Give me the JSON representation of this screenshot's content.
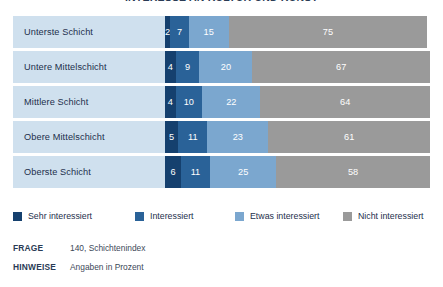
{
  "title": "INTERESSE AN KULTUR UND KUNST",
  "chart_data": {
    "type": "bar",
    "orientation": "horizontal",
    "stacked": true,
    "title": "INTERESSE AN KULTUR UND KUNST",
    "xlabel": "",
    "ylabel": "",
    "xlim": [
      0,
      100
    ],
    "grid": false,
    "legend_position": "bottom",
    "categories": [
      "Unterste Schicht",
      "Untere Mittelschicht",
      "Mittlere Schicht",
      "Obere Mittelschicht",
      "Oberste Schicht"
    ],
    "series": [
      {
        "name": "Sehr interessiert",
        "color": "#15406e",
        "values": [
          2,
          4,
          4,
          5,
          6
        ]
      },
      {
        "name": "Interessiert",
        "color": "#2a6298",
        "values": [
          7,
          9,
          10,
          11,
          11
        ]
      },
      {
        "name": "Etwas interessiert",
        "color": "#7ba7cf",
        "values": [
          15,
          20,
          22,
          23,
          25
        ]
      },
      {
        "name": "Nicht interessiert",
        "color": "#9a9a9a",
        "values": [
          75,
          67,
          64,
          61,
          58
        ]
      }
    ]
  },
  "rows": [
    {
      "label": "Unterste Schicht",
      "values": [
        2,
        7,
        15,
        75
      ]
    },
    {
      "label": "Untere Mittelschicht",
      "values": [
        4,
        9,
        20,
        67
      ]
    },
    {
      "label": "Mittlere Schicht",
      "values": [
        4,
        10,
        22,
        64
      ]
    },
    {
      "label": "Obere Mittelschicht",
      "values": [
        5,
        11,
        23,
        61
      ]
    },
    {
      "label": "Oberste Schicht",
      "values": [
        6,
        11,
        25,
        58
      ]
    }
  ],
  "legend": [
    {
      "label": "Sehr interessiert",
      "color": "#15406e"
    },
    {
      "label": "Interessiert",
      "color": "#2a6298"
    },
    {
      "label": "Etwas interessiert",
      "color": "#7ba7cf"
    },
    {
      "label": "Nicht interessiert",
      "color": "#9a9a9a"
    }
  ],
  "footer": {
    "frage_key": "FRAGE",
    "frage_value": "140, Schichtenindex",
    "hinweise_key": "HINWEISE",
    "hinweise_value": "Angaben in Prozent"
  }
}
